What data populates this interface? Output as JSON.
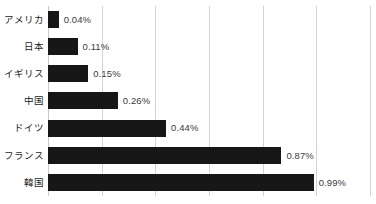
{
  "chart_data": {
    "type": "bar",
    "orientation": "horizontal",
    "title": "",
    "subtitle": "",
    "xlabel": "",
    "ylabel": "",
    "categories": [
      "アメリカ",
      "日本",
      "イギリス",
      "中国",
      "ドイツ",
      "フランス",
      "韓国"
    ],
    "values": [
      0.04,
      0.11,
      0.15,
      0.26,
      0.44,
      0.87,
      0.99
    ],
    "value_labels": [
      "0.04%",
      "0.11%",
      "0.15%",
      "0.26%",
      "0.44%",
      "0.87%",
      "0.99%"
    ],
    "unit": "%",
    "xlim": [
      0,
      1.2
    ],
    "x_gridline_values": [
      0,
      0.2,
      0.4,
      0.6,
      0.8,
      1.0,
      1.2
    ],
    "x_tick_labels": [],
    "grid": true,
    "grid_axis": "x",
    "legend": false,
    "legend_position": "none",
    "series": [
      {
        "name": "",
        "values": [
          0.04,
          0.11,
          0.15,
          0.26,
          0.44,
          0.87,
          0.99
        ]
      }
    ]
  },
  "style": {
    "bar_color": "#171717",
    "grid_color": "#d3d3d3",
    "label_color": "#1c1c1c",
    "value_color": "#3a3a3a",
    "background": "#ffffff"
  }
}
